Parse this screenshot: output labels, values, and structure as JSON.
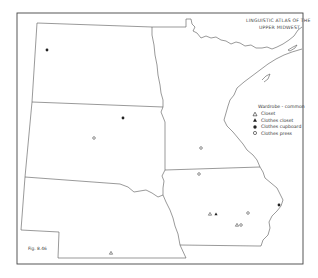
{
  "map": {
    "title_lines": [
      "LINGUISTIC ATLAS OF THE",
      "UPPER MIDWEST"
    ],
    "figure_label": "Fig. 8.46",
    "legend": {
      "title": "Wardrobe - common",
      "items": [
        {
          "symbol": "hollow-triangle",
          "label": "Closet"
        },
        {
          "symbol": "filled-triangle",
          "label": "Clothes closet"
        },
        {
          "symbol": "filled-circle",
          "label": "Clothes cupboard"
        },
        {
          "symbol": "hollow-circle",
          "label": "Clothes press"
        }
      ]
    },
    "regions": [
      "North Dakota",
      "South Dakota",
      "Nebraska",
      "Minnesota",
      "Iowa"
    ],
    "colors": {
      "line": "#555555",
      "frame": "#444444",
      "symbol": "#222222",
      "background": "#ffffff"
    },
    "markers": [
      {
        "symbol": "filled-circle",
        "x": 47,
        "y": 50
      },
      {
        "symbol": "filled-circle",
        "x": 123,
        "y": 118
      },
      {
        "symbol": "hollow-circle",
        "x": 94,
        "y": 138
      },
      {
        "symbol": "hollow-circle",
        "x": 201,
        "y": 148
      },
      {
        "symbol": "hollow-circle",
        "x": 199,
        "y": 174
      },
      {
        "symbol": "hollow-triangle",
        "x": 210,
        "y": 214
      },
      {
        "symbol": "filled-triangle",
        "x": 216,
        "y": 214
      },
      {
        "symbol": "hollow-circle",
        "x": 248,
        "y": 213
      },
      {
        "symbol": "hollow-triangle",
        "x": 237,
        "y": 225
      },
      {
        "symbol": "hollow-circle",
        "x": 241,
        "y": 225
      },
      {
        "symbol": "filled-circle",
        "x": 279,
        "y": 205
      },
      {
        "symbol": "hollow-triangle",
        "x": 111,
        "y": 253
      }
    ]
  }
}
